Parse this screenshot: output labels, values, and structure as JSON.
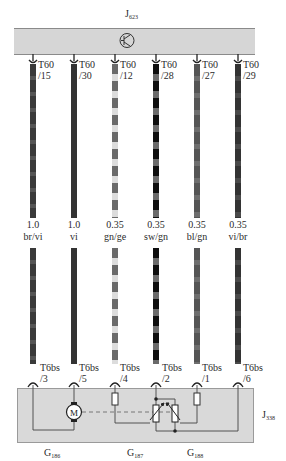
{
  "top_component": {
    "label": "J",
    "label_sub": "623",
    "symbol": "transistor-icon"
  },
  "bottom_component": {
    "label": "J",
    "label_sub": "338",
    "parts": [
      {
        "label": "G",
        "sub": "186",
        "symbol": "motor-icon",
        "symbol_text": "M"
      },
      {
        "label": "G",
        "sub": "187",
        "symbol": "potentiometer-icon"
      },
      {
        "label": "G",
        "sub": "188",
        "symbol": "potentiometer-icon"
      }
    ]
  },
  "wires": [
    {
      "top_conn": "T60",
      "top_pin": "/15",
      "size": "1.0",
      "color_code": "br/vi",
      "bottom_conn": "T6bs",
      "bottom_pin": "/3",
      "color_a": "#3a3a3a",
      "color_b": "#555555"
    },
    {
      "top_conn": "T60",
      "top_pin": "/30",
      "size": "1.0",
      "color_code": "vi",
      "bottom_conn": "T6bs",
      "bottom_pin": "/5",
      "color_a": "#333333",
      "color_b": "#333333"
    },
    {
      "top_conn": "T60",
      "top_pin": "/12",
      "size": "0.35",
      "color_code": "gn/ge",
      "bottom_conn": "T6bs",
      "bottom_pin": "/4",
      "color_a": "#6a6a6a",
      "color_b": "#dcdcdc"
    },
    {
      "top_conn": "T60",
      "top_pin": "/28",
      "size": "0.35",
      "color_code": "sw/gn",
      "bottom_conn": "T6bs",
      "bottom_pin": "/2",
      "color_a": "#0e0e0e",
      "color_b": "#6a6a6a"
    },
    {
      "top_conn": "T60",
      "top_pin": "/27",
      "size": "0.35",
      "color_code": "bl/gn",
      "bottom_conn": "T6bs",
      "bottom_pin": "/1",
      "color_a": "#555555",
      "color_b": "#6e6e6e"
    },
    {
      "top_conn": "T60",
      "top_pin": "/29",
      "size": "0.35",
      "color_code": "vi/br",
      "bottom_conn": "T6bs",
      "bottom_pin": "/6",
      "color_a": "#333333",
      "color_b": "#4a4a4a"
    }
  ]
}
